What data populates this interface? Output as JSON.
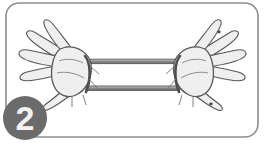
{
  "figure": {
    "name": "exercise-step-illustration",
    "caption": "Two hands stretching an elastic resistance loop band outward",
    "background_color": "#ffffff",
    "frame": {
      "name": "rounded-card-frame",
      "border_color": "#8e8e8e",
      "fill_color": "#ffffff",
      "corner_radius": 13,
      "border_width": 1.6,
      "x": 6,
      "y": 3,
      "width": 252,
      "height": 134
    },
    "step_badge": {
      "name": "step-number-badge",
      "label": "2",
      "circle_color": "#6b6b6b",
      "text_color": "#f2f2f2",
      "center_x": 25,
      "center_y": 118,
      "radius": 22
    },
    "band": {
      "name": "elastic-loop-band",
      "label": "elastic loop band",
      "fill_color": "#8a8a8a",
      "outline_color": "#4a4a4a",
      "top_strand_y": 61,
      "bottom_strand_y": 88,
      "left_x": 88,
      "right_x": 178,
      "strand_thickness": 4
    },
    "hands": [
      {
        "name": "left-hand",
        "label": "left hand",
        "side": "left",
        "fill_color": "#f0f0f0",
        "outline_color": "#595959",
        "finger_count": 4,
        "thumb": true,
        "palm_center_x": 62,
        "palm_center_y": 70
      },
      {
        "name": "right-hand",
        "label": "right hand",
        "side": "right",
        "fill_color": "#f0f0f0",
        "outline_color": "#595959",
        "finger_count": 4,
        "thumb": true,
        "palm_center_x": 203,
        "palm_center_y": 70
      }
    ],
    "tension_marks": {
      "name": "tension-lines",
      "color": "#6e6e6e",
      "count": 8
    }
  }
}
